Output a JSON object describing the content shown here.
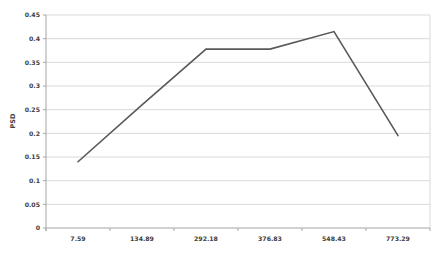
{
  "chart_data": {
    "type": "line",
    "title": "",
    "xlabel": "",
    "ylabel": "PSD",
    "categories": [
      "7.59",
      "134.89",
      "292.18",
      "376.83",
      "548.43",
      "773.29"
    ],
    "series": [
      {
        "name": "PSD",
        "values": [
          0.14,
          0.26,
          0.378,
          0.378,
          0.415,
          0.195
        ]
      }
    ],
    "ylim": [
      0,
      0.45
    ],
    "ytick_step": 0.05,
    "yticks": [
      {
        "value": 0,
        "label": "0"
      },
      {
        "value": 0.05,
        "label": "0.05"
      },
      {
        "value": 0.1,
        "label": "0.1"
      },
      {
        "value": 0.15,
        "label": "0.15"
      },
      {
        "value": 0.2,
        "label": "0.2"
      },
      {
        "value": 0.25,
        "label": "0.25"
      },
      {
        "value": 0.3,
        "label": "0.3"
      },
      {
        "value": 0.35,
        "label": "0.35"
      },
      {
        "value": 0.4,
        "label": "0.4"
      },
      {
        "value": 0.45,
        "label": "0.45"
      }
    ],
    "grid": "horizontal",
    "legend": "none",
    "colors": {
      "line": "#595959",
      "gridline": "#d9d9d9",
      "axis": "#a6a6a6",
      "label": "#404040",
      "background": "#ffffff"
    }
  }
}
